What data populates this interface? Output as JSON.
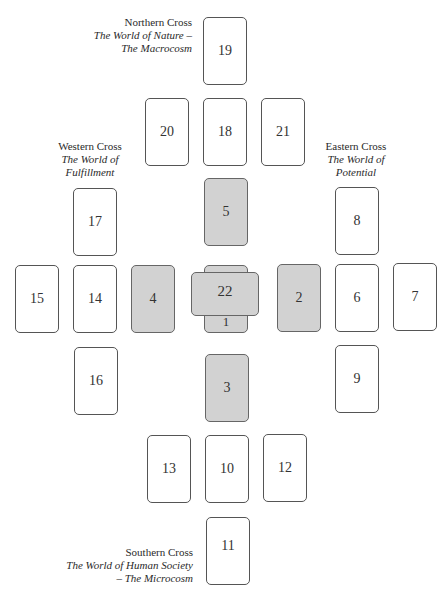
{
  "labels": {
    "north": {
      "title": "Northern Cross",
      "sub1": "The World of Nature –",
      "sub2": "The Macrocosm"
    },
    "west": {
      "title": "Western Cross",
      "sub1": "The World of",
      "sub2": "Fulfillment"
    },
    "east": {
      "title": "Eastern Cross",
      "sub1": "The World of",
      "sub2": "Potential"
    },
    "south": {
      "title": "Southern Cross",
      "sub1": "The World of Human Society",
      "sub2": "– The Microcosm"
    }
  },
  "cards": {
    "c1": "1",
    "c2": "2",
    "c3": "3",
    "c4": "4",
    "c5": "5",
    "c6": "6",
    "c7": "7",
    "c8": "8",
    "c9": "9",
    "c10": "10",
    "c11": "11",
    "c12": "12",
    "c13": "13",
    "c14": "14",
    "c15": "15",
    "c16": "16",
    "c17": "17",
    "c18": "18",
    "c19": "19",
    "c20": "20",
    "c21": "21",
    "c22": "22"
  },
  "colors": {
    "shaded_card": "#d2d2d2",
    "plain_card": "#ffffff",
    "border": "#555555"
  }
}
